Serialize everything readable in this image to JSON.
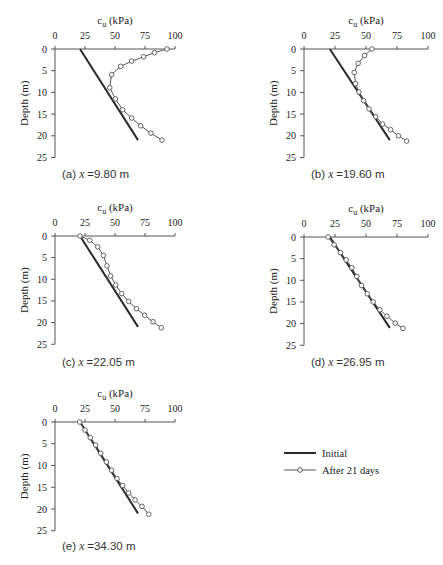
{
  "figure": {
    "legend": {
      "items": [
        {
          "label": "Initial",
          "style": "solid-thick"
        },
        {
          "label": "After 21 days",
          "style": "line-circle"
        }
      ]
    },
    "colors": {
      "initial_line": "#2a2a2a",
      "after_line": "#555555",
      "marker_fill": "#ffffff",
      "axis": "#555555"
    }
  },
  "chart_data": [
    {
      "id": "a",
      "type": "line",
      "caption_prefix": "(a)",
      "caption_var": "x",
      "caption_value": "=9.80 m",
      "title": "c_u (kPa)",
      "xlabel": "c_u (kPa)",
      "ylabel": "Depth (m)",
      "xlim": [
        0,
        100
      ],
      "ylim": [
        0,
        25
      ],
      "xticks": [
        0,
        25,
        50,
        75,
        100
      ],
      "yticks": [
        0,
        5,
        10,
        15,
        20,
        25
      ],
      "y_inverted": true,
      "x_axis_position": "top",
      "grid": false,
      "series": [
        {
          "name": "Initial",
          "points": [
            [
              20.8,
              0
            ],
            [
              69.2,
              21
            ]
          ]
        },
        {
          "name": "After 21 days",
          "points": [
            [
              93.3,
              0
            ],
            [
              82.8,
              0.85
            ],
            [
              73.9,
              1.8
            ],
            [
              63.9,
              2.8
            ],
            [
              54.7,
              4.0
            ],
            [
              47.2,
              5.9
            ],
            [
              45.6,
              8.9
            ],
            [
              50.3,
              11.5
            ],
            [
              56.4,
              14.0
            ],
            [
              63.9,
              15.9
            ],
            [
              71.4,
              17.7
            ],
            [
              80.0,
              19.4
            ],
            [
              89.2,
              21.0
            ]
          ]
        }
      ]
    },
    {
      "id": "b",
      "type": "line",
      "caption_prefix": "(b)",
      "caption_var": "x",
      "caption_value": "=19.60 m",
      "title": "c_u (kPa)",
      "xlabel": "c_u (kPa)",
      "ylabel": "Depth (m)",
      "xlim": [
        0,
        100
      ],
      "ylim": [
        0,
        25
      ],
      "xticks": [
        0,
        25,
        50,
        75,
        100
      ],
      "yticks": [
        0,
        5,
        10,
        15,
        20,
        25
      ],
      "y_inverted": true,
      "x_axis_position": "top",
      "grid": false,
      "series": [
        {
          "name": "Initial",
          "points": [
            [
              20.8,
              0
            ],
            [
              69.2,
              21
            ]
          ]
        },
        {
          "name": "After 21 days",
          "points": [
            [
              54.8,
              0
            ],
            [
              48.9,
              1.5
            ],
            [
              43.7,
              3.3
            ],
            [
              40.5,
              5.4
            ],
            [
              41.6,
              8.0
            ],
            [
              44.3,
              9.9
            ],
            [
              48.1,
              11.9
            ],
            [
              52.4,
              13.8
            ],
            [
              57.8,
              15.6
            ],
            [
              63.4,
              17.3
            ],
            [
              69.9,
              18.6
            ],
            [
              76.1,
              20.0
            ],
            [
              82.8,
              21.2
            ]
          ]
        }
      ]
    },
    {
      "id": "c",
      "type": "line",
      "caption_prefix": "(c)",
      "caption_var": "x",
      "caption_value": "=22.05 m",
      "title": "c_u (kPa)",
      "xlabel": "c_u (kPa)",
      "ylabel": "Depth (m)",
      "xlim": [
        0,
        100
      ],
      "ylim": [
        0,
        25
      ],
      "xticks": [
        0,
        25,
        50,
        75,
        100
      ],
      "yticks": [
        0,
        5,
        10,
        15,
        20,
        25
      ],
      "y_inverted": true,
      "x_axis_position": "top",
      "grid": false,
      "series": [
        {
          "name": "Initial",
          "points": [
            [
              20.8,
              0
            ],
            [
              69.2,
              21
            ]
          ]
        },
        {
          "name": "After 21 days",
          "points": [
            [
              20.8,
              0
            ],
            [
              28.9,
              1.0
            ],
            [
              35.6,
              2.5
            ],
            [
              40.3,
              4.5
            ],
            [
              43.3,
              6.9
            ],
            [
              46.4,
              9.2
            ],
            [
              50.6,
              11.3
            ],
            [
              55.6,
              13.3
            ],
            [
              61.4,
              15.1
            ],
            [
              67.8,
              16.8
            ],
            [
              74.7,
              18.3
            ],
            [
              81.7,
              19.8
            ],
            [
              88.6,
              21.2
            ]
          ]
        }
      ]
    },
    {
      "id": "d",
      "type": "line",
      "caption_prefix": "(d)",
      "caption_var": "x",
      "caption_value": "=26.95 m",
      "title": "c_u (kPa)",
      "xlabel": "c_u (kPa)",
      "ylabel": "Depth (m)",
      "xlim": [
        0,
        100
      ],
      "ylim": [
        0,
        25
      ],
      "xticks": [
        0,
        25,
        50,
        75,
        100
      ],
      "yticks": [
        0,
        5,
        10,
        15,
        20,
        25
      ],
      "y_inverted": true,
      "x_axis_position": "top",
      "grid": false,
      "series": [
        {
          "name": "Initial",
          "points": [
            [
              20.8,
              0
            ],
            [
              69.2,
              21
            ]
          ]
        },
        {
          "name": "After 21 days",
          "points": [
            [
              19.4,
              0
            ],
            [
              24.3,
              1.8
            ],
            [
              29.4,
              3.6
            ],
            [
              34.0,
              5.3
            ],
            [
              38.6,
              7.1
            ],
            [
              42.6,
              9.1
            ],
            [
              46.4,
              11.2
            ],
            [
              51.0,
              13.1
            ],
            [
              55.8,
              15.0
            ],
            [
              61.2,
              16.8
            ],
            [
              66.9,
              18.3
            ],
            [
              73.6,
              19.9
            ],
            [
              79.8,
              21.1
            ]
          ]
        }
      ]
    },
    {
      "id": "e",
      "type": "line",
      "caption_prefix": "(e)",
      "caption_var": "x",
      "caption_value": "=34.30 m",
      "title": "c_u (kPa)",
      "xlabel": "c_u (kPa)",
      "ylabel": "Depth (m)",
      "xlim": [
        0,
        100
      ],
      "ylim": [
        0,
        25
      ],
      "xticks": [
        0,
        25,
        50,
        75,
        100
      ],
      "yticks": [
        0,
        5,
        10,
        15,
        20,
        25
      ],
      "y_inverted": true,
      "x_axis_position": "top",
      "grid": false,
      "series": [
        {
          "name": "Initial",
          "points": [
            [
              20.8,
              0
            ],
            [
              69.2,
              21
            ]
          ]
        },
        {
          "name": "After 21 days",
          "points": [
            [
              20.6,
              0
            ],
            [
              25.0,
              1.85
            ],
            [
              29.4,
              3.6
            ],
            [
              33.9,
              5.3
            ],
            [
              38.1,
              7.2
            ],
            [
              42.8,
              9.2
            ],
            [
              47.2,
              11.1
            ],
            [
              51.7,
              13.0
            ],
            [
              56.4,
              14.6
            ],
            [
              61.4,
              16.3
            ],
            [
              66.7,
              17.9
            ],
            [
              72.5,
              19.4
            ],
            [
              78.1,
              21.2
            ]
          ]
        }
      ]
    }
  ],
  "layout": {
    "panels": [
      {
        "x0": 55,
        "x100": 175,
        "y0": 49,
        "ypm": 4.34,
        "caption_x": 62,
        "caption_y": 178
      },
      {
        "x0": 304,
        "x100": 428,
        "y0": 49,
        "ypm": 4.34,
        "caption_x": 311,
        "caption_y": 178
      },
      {
        "x0": 55,
        "x100": 175,
        "y0": 236,
        "ypm": 4.33,
        "caption_x": 62,
        "caption_y": 366
      },
      {
        "x0": 304,
        "x100": 428,
        "y0": 237,
        "ypm": 4.33,
        "caption_x": 311,
        "caption_y": 366
      },
      {
        "x0": 55,
        "x100": 175,
        "y0": 422,
        "ypm": 4.35,
        "caption_x": 62,
        "caption_y": 550
      }
    ],
    "legend": {
      "x1": 284,
      "x2": 316,
      "text_x": 322,
      "rows_y": [
        453,
        470
      ]
    }
  }
}
